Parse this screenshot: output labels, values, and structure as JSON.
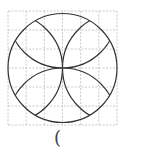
{
  "diagram": {
    "grid": {
      "rows": 6,
      "cols": 6,
      "x0": 8,
      "y0": 11,
      "x1": 117,
      "y1": 125,
      "color": "#bbbbbb",
      "style": "dashed"
    },
    "circle": {
      "cx": 62.5,
      "cy": 68,
      "r": 54.5,
      "stroke": "#333333"
    },
    "arcs": [
      {
        "center": "top"
      },
      {
        "center": "bottom"
      },
      {
        "center": "left"
      },
      {
        "center": "right"
      }
    ]
  },
  "answer_blank": {
    "text": "("
  }
}
